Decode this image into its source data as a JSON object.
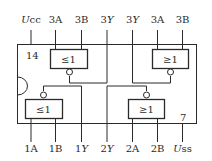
{
  "chip": {
    "top_pins": [
      {
        "label_prefix": "U",
        "label_suffix": "cc",
        "italic_prefix": true
      },
      {
        "label_prefix": "",
        "label_suffix": "3A",
        "italic_prefix": false
      },
      {
        "label_prefix": "",
        "label_suffix": "3B",
        "italic_prefix": false
      },
      {
        "label_prefix": "3",
        "label_suffix": "Y",
        "italic_suffix": true
      },
      {
        "label_prefix": "3",
        "label_suffix": "Y",
        "italic_suffix": true
      },
      {
        "label_prefix": "",
        "label_suffix": "3A",
        "italic_prefix": false
      },
      {
        "label_prefix": "",
        "label_suffix": "3B",
        "italic_prefix": false
      }
    ],
    "bottom_pins": [
      {
        "label_prefix": "",
        "label_suffix": "1A"
      },
      {
        "label_prefix": "",
        "label_suffix": "1B"
      },
      {
        "label_prefix": "1",
        "label_suffix": "Y",
        "italic_suffix": true
      },
      {
        "label_prefix": "2",
        "label_suffix": "Y",
        "italic_suffix": true
      },
      {
        "label_prefix": "",
        "label_suffix": "2A"
      },
      {
        "label_prefix": "",
        "label_suffix": "2B"
      },
      {
        "label_prefix": "U",
        "label_suffix": "ss",
        "italic_prefix": true
      }
    ],
    "pin_number_top_left": "14",
    "pin_number_bottom_right": "7",
    "gates": {
      "top_left": "≤1",
      "top_right": "≥1",
      "bottom_left": "≤1",
      "bottom_right": "≥1"
    }
  }
}
